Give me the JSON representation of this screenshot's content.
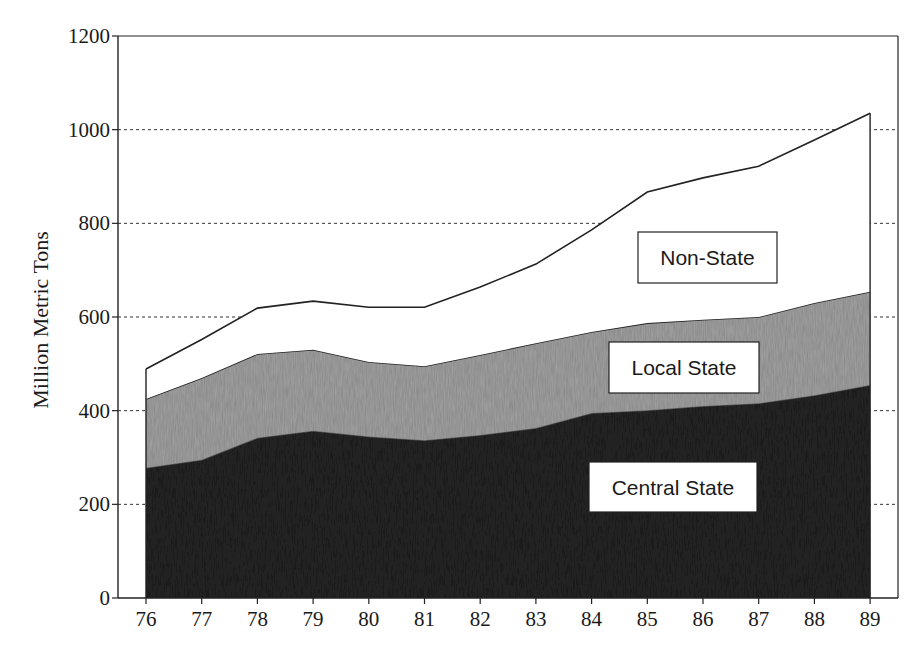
{
  "chart_data": {
    "type": "area",
    "stacked": true,
    "title": "",
    "xlabel": "",
    "ylabel": "Million Metric Tons",
    "x": [
      "76",
      "77",
      "78",
      "79",
      "80",
      "81",
      "82",
      "83",
      "84",
      "85",
      "86",
      "87",
      "88",
      "89"
    ],
    "ylim": [
      0,
      1200
    ],
    "yticks": [
      0,
      200,
      400,
      600,
      800,
      1000,
      1200
    ],
    "grid": "horizontal dotted at 200-1000",
    "legend": "inline labeled boxes",
    "series": [
      {
        "name": "Central State",
        "color": "#262626",
        "values": [
          278,
          295,
          342,
          357,
          345,
          337,
          348,
          363,
          395,
          401,
          410,
          416,
          433,
          455
        ]
      },
      {
        "name": "Local State",
        "color": "#a6a6a6",
        "values": [
          147,
          175,
          179,
          173,
          159,
          158,
          171,
          181,
          173,
          186,
          184,
          184,
          197,
          199
        ]
      },
      {
        "name": "Non-State",
        "color": "#ffffff",
        "values": [
          64,
          82,
          98,
          104,
          117,
          126,
          145,
          169,
          218,
          280,
          303,
          322,
          348,
          381
        ]
      }
    ],
    "cumulative_totals": [
      489,
      552,
      619,
      634,
      621,
      621,
      664,
      713,
      786,
      867,
      897,
      922,
      978,
      1035
    ]
  },
  "labels": {
    "non_state": "Non-State",
    "local_state": "Local State",
    "central_state": "Central State"
  }
}
